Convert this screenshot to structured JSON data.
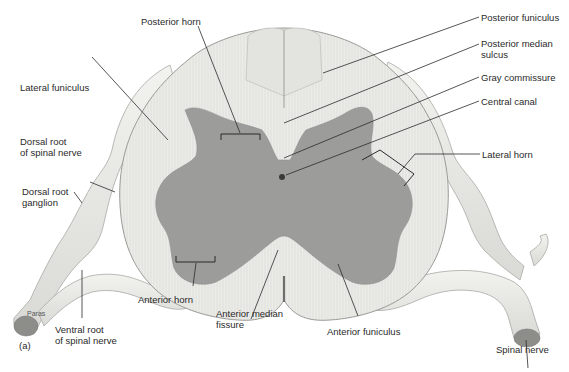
{
  "figure": {
    "panel_label": "(a)",
    "artist_credit": "Paras",
    "colors": {
      "white_matter": "#e9e9e6",
      "white_matter_stroke": "#9a9a96",
      "gray_matter": "#9c9c9a",
      "nerve": "#e6e6e3",
      "nerve_stroke": "#a8a8a4",
      "leader": "#2b2b2b",
      "background": "#ffffff"
    }
  },
  "labels": {
    "posterior_horn": "Posterior horn",
    "lateral_funiculus": "Lateral funiculus",
    "dorsal_root_nerve": "Dorsal root\nof spinal nerve",
    "dorsal_root_ganglion": "Dorsal root\nganglion",
    "anterior_horn": "Anterior horn",
    "anterior_median_fissure": "Anterior median\nfissure",
    "ventral_root": "Ventral root\nof spinal nerve",
    "anterior_funiculus": "Anterior funiculus",
    "spinal_nerve": "Spinal nerve",
    "posterior_funiculus": "Posterior funiculus",
    "posterior_median_sulcus": "Posterior median\nsulcus",
    "gray_commissure": "Gray commissure",
    "central_canal": "Central canal",
    "lateral_horn": "Lateral horn"
  }
}
